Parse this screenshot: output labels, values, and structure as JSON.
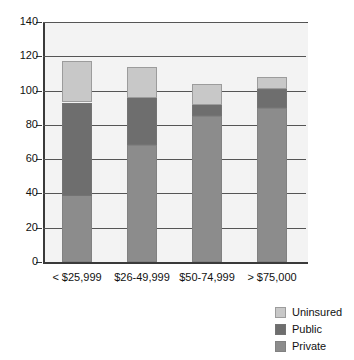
{
  "chart_data": {
    "type": "bar",
    "stacked": true,
    "title": "",
    "subtitle": "",
    "xlabel": "",
    "ylabel": "",
    "categories": [
      "< $25,999",
      "$26-49,999",
      "$50-74,999",
      "> $75,000"
    ],
    "series": [
      {
        "name": "Private",
        "color": "#8c8c8c",
        "values": [
          39,
          68,
          85,
          90
        ]
      },
      {
        "name": "Public",
        "color": "#6e6e6e",
        "values": [
          54,
          28,
          7,
          11
        ]
      },
      {
        "name": "Uninsured",
        "color": "#c8c8c8",
        "values": [
          24,
          18,
          12,
          7
        ]
      }
    ],
    "stack_totals": [
      117,
      114,
      104,
      108
    ],
    "ylim": [
      0,
      140
    ],
    "ytick_values": [
      0,
      20,
      40,
      60,
      80,
      100,
      120,
      140
    ],
    "ytick_labels": [
      "0",
      "20",
      "40",
      "60",
      "80",
      "100",
      "120",
      "140"
    ],
    "grid": "horizontal",
    "legend_position": "bottom-right",
    "legend_order": [
      "Uninsured",
      "Public",
      "Private"
    ],
    "plot_background": "#f3f3f3",
    "axis_color": "#3a3a3a"
  },
  "legend": {
    "items": [
      {
        "label": "Uninsured",
        "color": "#c8c8c8"
      },
      {
        "label": "Public",
        "color": "#6e6e6e"
      },
      {
        "label": "Private",
        "color": "#8c8c8c"
      }
    ]
  }
}
